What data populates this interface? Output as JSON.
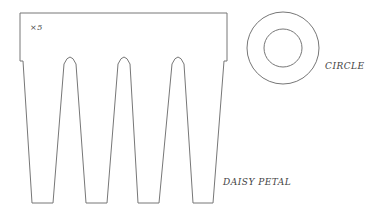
{
  "diagram": {
    "multiplier_label": "×5",
    "circle_label": "CIRCLE",
    "petal_label": "DAISY PETAL",
    "stroke_color": "#666666"
  }
}
